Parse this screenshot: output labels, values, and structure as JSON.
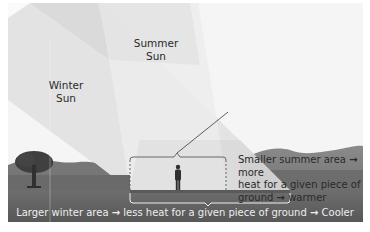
{
  "figure": {
    "type": "illustration",
    "labels": {
      "summer_sun": [
        "Summer",
        "Sun"
      ],
      "winter_sun": [
        "Winter",
        "Sun"
      ]
    },
    "callout": {
      "lines": [
        {
          "text": "Smaller summer area",
          "arrow": "→",
          "after": "more"
        },
        {
          "text": "heat for a given piece of"
        },
        {
          "text": "ground",
          "arrow": "→",
          "after": "warmer"
        }
      ]
    },
    "caption": {
      "part1": "Larger winter area",
      "arrow1": "→",
      "part2": "less heat for a given piece of ground",
      "arrow2": "→",
      "part3": "Cooler"
    },
    "icons": [
      "tree-icon",
      "person-icon",
      "brace-icon"
    ],
    "colors": {
      "sky": "#f4f4f4",
      "summer_beam": "#e6e6e6",
      "winter_beam": "#dcdcdc",
      "ground_dark": "#5e5e5e",
      "mountains": "#7a7a7a",
      "bracket": "#f2f2f2",
      "text": "#2a2a2a"
    }
  }
}
